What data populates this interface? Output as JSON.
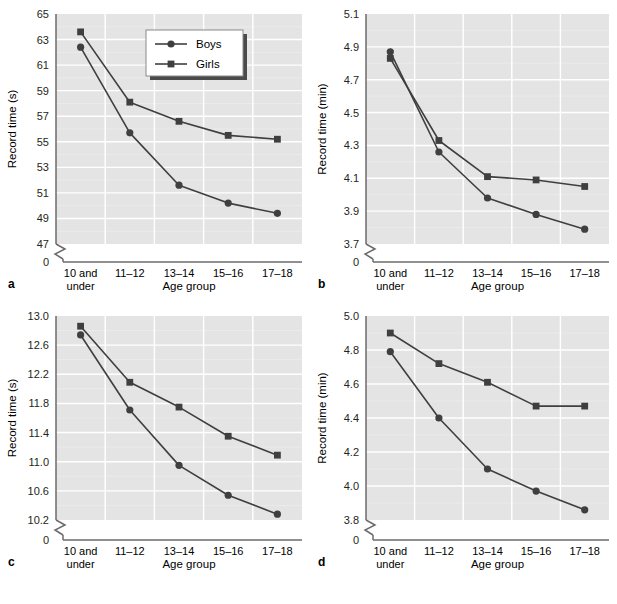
{
  "figure": {
    "panels": [
      "a",
      "b",
      "c",
      "d"
    ],
    "series_colors": {
      "boys": "#4d4d4d",
      "girls": "#4d4d4d"
    },
    "plot_background": "#e4e4e4",
    "gridline_color": "#ffffff",
    "axis_color": "#6b6b6b"
  },
  "legend": {
    "present_in_panel": "a",
    "entries": [
      {
        "label": "Boys",
        "marker": "circle"
      },
      {
        "label": "Girls",
        "marker": "square"
      }
    ]
  },
  "chart_data": [
    {
      "panel": "a",
      "type": "line",
      "title": "",
      "xlabel": "Age group",
      "ylabel": "Record time (s)",
      "categories": [
        "10 and under",
        "11–12",
        "13–14",
        "15–16",
        "17–18"
      ],
      "xtick_lines": [
        [
          "10 and",
          "under"
        ],
        [
          "11–12"
        ],
        [
          "13–14"
        ],
        [
          "15–16"
        ],
        [
          "17–18"
        ]
      ],
      "ylim": [
        47,
        65
      ],
      "yticks": [
        47,
        49,
        51,
        53,
        55,
        57,
        59,
        61,
        63,
        65
      ],
      "ytick_labels": [
        "47",
        "49",
        "51",
        "53",
        "55",
        "57",
        "59",
        "61",
        "63",
        "65"
      ],
      "axis_break": true,
      "origin_label": "0",
      "grid": true,
      "legend_position": "upper right",
      "series": [
        {
          "name": "Boys",
          "marker": "circle",
          "values": [
            62.4,
            55.7,
            51.6,
            50.2,
            49.4
          ]
        },
        {
          "name": "Girls",
          "marker": "square",
          "values": [
            63.6,
            58.1,
            56.6,
            55.5,
            55.2
          ]
        }
      ]
    },
    {
      "panel": "b",
      "type": "line",
      "title": "",
      "xlabel": "Age group",
      "ylabel": "Record time (min)",
      "categories": [
        "10 and under",
        "11–12",
        "13–14",
        "15–16",
        "17–18"
      ],
      "xtick_lines": [
        [
          "10 and",
          "under"
        ],
        [
          "11–12"
        ],
        [
          "13–14"
        ],
        [
          "15–16"
        ],
        [
          "17–18"
        ]
      ],
      "ylim": [
        3.7,
        5.1
      ],
      "yticks": [
        3.7,
        3.9,
        4.1,
        4.3,
        4.5,
        4.7,
        4.9,
        5.1
      ],
      "ytick_labels": [
        "3.7",
        "3.9",
        "4.1",
        "4.3",
        "4.5",
        "4.7",
        "4.9",
        "5.1"
      ],
      "axis_break": true,
      "origin_label": "0",
      "grid": true,
      "legend_position": "none",
      "series": [
        {
          "name": "Boys",
          "marker": "circle",
          "values": [
            4.87,
            4.26,
            3.98,
            3.88,
            3.79
          ]
        },
        {
          "name": "Girls",
          "marker": "square",
          "values": [
            4.83,
            4.33,
            4.11,
            4.09,
            4.05
          ]
        }
      ]
    },
    {
      "panel": "c",
      "type": "line",
      "title": "",
      "xlabel": "Age group",
      "ylabel": "Record time (s)",
      "categories": [
        "10 and under",
        "11–12",
        "13–14",
        "15–16",
        "17–18"
      ],
      "xtick_lines": [
        [
          "10 and",
          "under"
        ],
        [
          "11–12"
        ],
        [
          "13–14"
        ],
        [
          "15–16"
        ],
        [
          "17–18"
        ]
      ],
      "ylim": [
        10.2,
        13.0
      ],
      "yticks": [
        10.2,
        10.6,
        11.0,
        11.4,
        11.8,
        12.2,
        12.6,
        13.0
      ],
      "ytick_labels": [
        "10.2",
        "10.6",
        "11.0",
        "11.4",
        "11.8",
        "12.2",
        "12.6",
        "13.0"
      ],
      "axis_break": true,
      "origin_label": "0",
      "grid": true,
      "legend_position": "none",
      "series": [
        {
          "name": "Boys",
          "marker": "circle",
          "values": [
            12.74,
            11.71,
            10.95,
            10.54,
            10.28
          ]
        },
        {
          "name": "Girls",
          "marker": "square",
          "values": [
            12.86,
            12.09,
            11.75,
            11.35,
            11.09
          ]
        }
      ]
    },
    {
      "panel": "d",
      "type": "line",
      "title": "",
      "xlabel": "Age group",
      "ylabel": "Record time (min)",
      "categories": [
        "10 and under",
        "11–12",
        "13–14",
        "15–16",
        "17–18"
      ],
      "xtick_lines": [
        [
          "10 and",
          "under"
        ],
        [
          "11–12"
        ],
        [
          "13–14"
        ],
        [
          "15–16"
        ],
        [
          "17–18"
        ]
      ],
      "ylim": [
        3.8,
        5.0
      ],
      "yticks": [
        3.8,
        4.0,
        4.2,
        4.4,
        4.6,
        4.8,
        5.0
      ],
      "ytick_labels": [
        "3.8",
        "4.0",
        "4.2",
        "4.4",
        "4.6",
        "4.8",
        "5.0"
      ],
      "axis_break": true,
      "origin_label": "0",
      "grid": true,
      "legend_position": "none",
      "series": [
        {
          "name": "Boys",
          "marker": "circle",
          "values": [
            4.79,
            4.4,
            4.1,
            3.97,
            3.86
          ]
        },
        {
          "name": "Girls",
          "marker": "square",
          "values": [
            4.9,
            4.72,
            4.61,
            4.47,
            4.47
          ]
        }
      ]
    }
  ]
}
